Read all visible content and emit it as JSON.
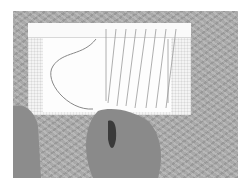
{
  "image": {
    "description": "Grayscale photo of two hands threading yarn through warp strings on a white cardboard weaving frame placed on a patterned carpet",
    "palette": {
      "background": "#a9a9a9",
      "frame": "#f4f4f4",
      "skin": "#8c8c8c",
      "border": "#ffffff"
    }
  }
}
